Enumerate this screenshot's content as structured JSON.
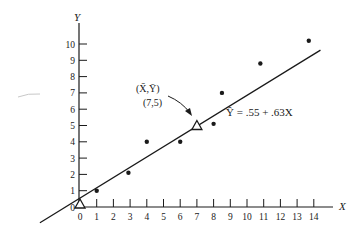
{
  "chart_data": {
    "type": "scatter",
    "title": "",
    "xlabel": "X",
    "ylabel": "Y",
    "xlim": [
      0,
      14
    ],
    "ylim": [
      0,
      10
    ],
    "x_ticks": [
      0,
      1,
      2,
      3,
      4,
      5,
      6,
      7,
      8,
      9,
      10,
      11,
      12,
      13,
      14
    ],
    "y_ticks": [
      0,
      1,
      2,
      3,
      4,
      5,
      6,
      7,
      8,
      9,
      10
    ],
    "grid": false,
    "legend": null,
    "series": [
      {
        "name": "observations",
        "marker": "dot",
        "points": [
          {
            "x": 1,
            "y": 1
          },
          {
            "x": 2.9,
            "y": 2.1
          },
          {
            "x": 4,
            "y": 4
          },
          {
            "x": 6,
            "y": 4
          },
          {
            "x": 8,
            "y": 5.1
          },
          {
            "x": 8.5,
            "y": 7
          },
          {
            "x": 10.8,
            "y": 8.8
          },
          {
            "x": 13.7,
            "y": 10.2
          }
        ]
      },
      {
        "name": "reference points",
        "marker": "open-triangle",
        "points": [
          {
            "x": 0,
            "y": 0
          },
          {
            "x": 7,
            "y": 5
          }
        ]
      }
    ],
    "regression_line": {
      "equation": "Ŷ = .55 + .63X",
      "intercept": 0.55,
      "slope": 0.63,
      "x_range": [
        -2.4,
        14.4
      ]
    },
    "annotations": [
      {
        "text": "(X̄,Ȳ)",
        "subtext": "(7,5)",
        "points_to": {
          "x": 7,
          "y": 5
        }
      }
    ]
  },
  "labels": {
    "x_axis": "X",
    "y_axis": "Y",
    "mean_label": "(X̄,Ȳ)",
    "mean_value": "(7,5)",
    "equation": "Ŷ = .55 + .63X",
    "x_ticks": [
      "0",
      "1",
      "2",
      "3",
      "4",
      "5",
      "6",
      "7",
      "8",
      "9",
      "10",
      "11",
      "12",
      "13",
      "14"
    ],
    "y_ticks": [
      "0",
      "1",
      "2",
      "3",
      "4",
      "5",
      "6",
      "7",
      "8",
      "9",
      "10"
    ]
  }
}
